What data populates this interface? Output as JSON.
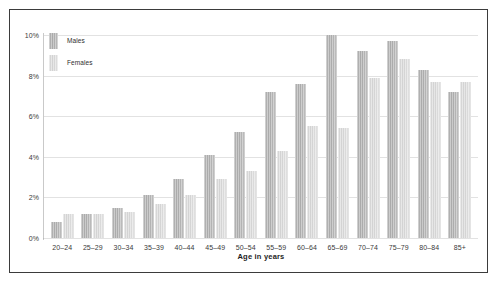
{
  "chart_data": {
    "type": "bar",
    "title": "",
    "xlabel": "Age in years",
    "ylabel": "",
    "ylim": [
      0,
      10
    ],
    "yticks": [
      "0%",
      "2%",
      "4%",
      "6%",
      "8%",
      "10%"
    ],
    "ytick_values": [
      0,
      2,
      4,
      6,
      8,
      10
    ],
    "grid": true,
    "legend_position": "top-left",
    "categories": [
      "20–24",
      "25–29",
      "30–34",
      "35–39",
      "40–44",
      "45–49",
      "50–54",
      "55–59",
      "60–64",
      "65–69",
      "70–74",
      "75–79",
      "80–84",
      "85+"
    ],
    "series": [
      {
        "name": "Males",
        "color": "#aeaeae",
        "values": [
          0.8,
          1.2,
          1.5,
          2.1,
          2.9,
          4.1,
          5.2,
          7.2,
          7.6,
          10.0,
          9.2,
          9.7,
          8.3,
          7.2
        ]
      },
      {
        "name": "Females",
        "color": "#d6d6d6",
        "values": [
          1.2,
          1.2,
          1.3,
          1.7,
          2.1,
          2.9,
          3.3,
          4.3,
          5.5,
          5.4,
          7.9,
          8.8,
          7.7,
          7.7
        ]
      }
    ]
  },
  "legend": {
    "entries": [
      {
        "label": "Males"
      },
      {
        "label": "Females"
      }
    ]
  },
  "axis": {
    "x_title": "Age in years"
  }
}
